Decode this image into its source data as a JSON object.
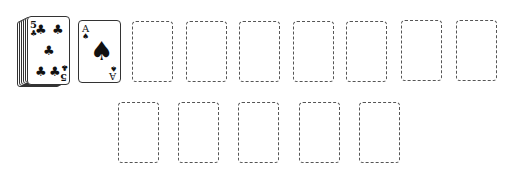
{
  "game": "Solitaire",
  "stock": {
    "top_card": {
      "rank": "5",
      "suit": "clubs",
      "suit_glyph": "♣",
      "face_up": true
    },
    "stacked_cards_behind": 5
  },
  "waste": {
    "top_card": {
      "rank": "A",
      "suit": "spades",
      "suit_glyph": "♠",
      "face_up": true
    }
  },
  "top_row_slots": [
    {
      "empty": true
    },
    {
      "empty": true
    },
    {
      "empty": true
    },
    {
      "empty": true
    },
    {
      "empty": true
    },
    {
      "empty": true
    },
    {
      "empty": true
    }
  ],
  "bottom_row_slots": [
    {
      "empty": true
    },
    {
      "empty": true
    },
    {
      "empty": true
    },
    {
      "empty": true
    },
    {
      "empty": true
    }
  ],
  "colors": {
    "background": "#ffffff",
    "card_border": "#333333",
    "slot_border": "#555555",
    "ink": "#111111"
  }
}
